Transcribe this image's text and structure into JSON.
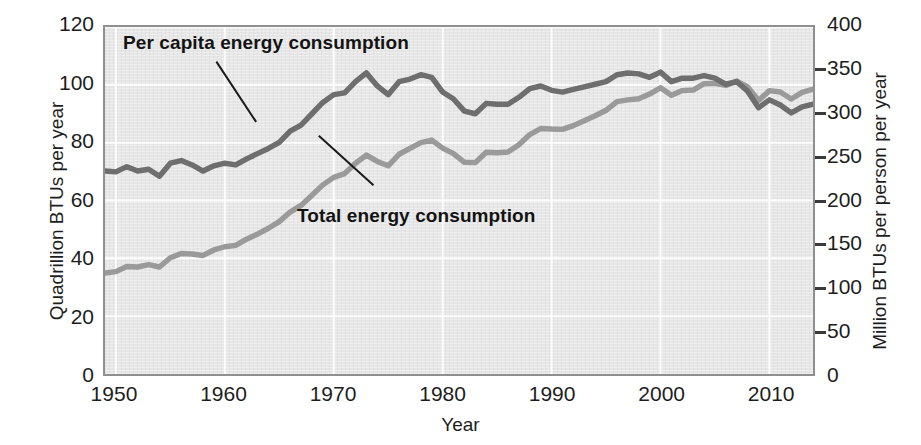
{
  "chart_data": {
    "type": "line",
    "title": "",
    "xlabel": "Year",
    "ylabel": "Quadrillion BTUs per year",
    "ylabel_right": "Million BTUs per person per year",
    "xlim": [
      1949,
      2014
    ],
    "ylim": [
      0,
      120
    ],
    "ylim_right": [
      0,
      400
    ],
    "grid": true,
    "legend_position": "in-plot-annotations",
    "xticks": [
      1950,
      1960,
      1970,
      1980,
      1990,
      2000,
      2010
    ],
    "xtick_labels": [
      "1950",
      "1960",
      "1970",
      "1980",
      "1990",
      "2000",
      "2010"
    ],
    "yticks_left": [
      0,
      20,
      40,
      60,
      80,
      100,
      120
    ],
    "ytick_labels_left": [
      "0",
      "20",
      "40",
      "60",
      "80",
      "100",
      "120"
    ],
    "yticks_right": [
      0,
      50,
      100,
      150,
      200,
      250,
      300,
      350,
      400
    ],
    "ytick_labels_right": [
      "0",
      "50",
      "100",
      "150",
      "200",
      "250",
      "300",
      "350",
      "400"
    ],
    "x": [
      1949,
      1950,
      1951,
      1952,
      1953,
      1954,
      1955,
      1956,
      1957,
      1958,
      1959,
      1960,
      1961,
      1962,
      1963,
      1964,
      1965,
      1966,
      1967,
      1968,
      1969,
      1970,
      1971,
      1972,
      1973,
      1974,
      1975,
      1976,
      1977,
      1978,
      1979,
      1980,
      1981,
      1982,
      1983,
      1984,
      1985,
      1986,
      1987,
      1988,
      1989,
      1990,
      1991,
      1992,
      1993,
      1994,
      1995,
      1996,
      1997,
      1998,
      1999,
      2000,
      2001,
      2002,
      2003,
      2004,
      2005,
      2006,
      2007,
      2008,
      2009,
      2010,
      2011,
      2012,
      2013,
      2014
    ],
    "series": [
      {
        "name": "Per capita energy consumption",
        "axis": "right",
        "units": "Million BTUs per person per year",
        "color": "#6e6e6e",
        "values": [
          234,
          233,
          239,
          234,
          236,
          228,
          243,
          246,
          241,
          234,
          240,
          243,
          241,
          248,
          254,
          260,
          267,
          280,
          287,
          300,
          313,
          322,
          324,
          337,
          347,
          332,
          322,
          337,
          340,
          345,
          342,
          325,
          317,
          303,
          300,
          312,
          311,
          311,
          319,
          329,
          332,
          327,
          325,
          328,
          331,
          334,
          337,
          345,
          347,
          346,
          342,
          348,
          337,
          341,
          341,
          344,
          341,
          334,
          337,
          326,
          307,
          316,
          310,
          301,
          308,
          311
        ]
      },
      {
        "name": "Total energy consumption",
        "axis": "left",
        "units": "Quadrillion BTUs per year",
        "color": "#9a9a9a",
        "values": [
          34.9,
          35.4,
          37.2,
          37.0,
          37.8,
          37.0,
          40.2,
          41.7,
          41.5,
          41.0,
          42.9,
          44.0,
          44.5,
          46.6,
          48.4,
          50.4,
          52.7,
          56.0,
          58.3,
          61.8,
          65.4,
          68.0,
          69.3,
          72.9,
          75.7,
          73.5,
          72.0,
          76.0,
          78.0,
          80.0,
          80.9,
          78.1,
          76.2,
          73.2,
          73.1,
          76.7,
          76.5,
          76.8,
          79.3,
          82.8,
          84.9,
          84.7,
          84.6,
          85.9,
          87.6,
          89.3,
          91.2,
          94.2,
          94.8,
          95.2,
          96.8,
          99.0,
          96.4,
          98.0,
          98.2,
          100.4,
          100.5,
          99.8,
          101.3,
          99.3,
          94.6,
          98.0,
          97.5,
          95.1,
          97.4,
          98.5
        ]
      }
    ],
    "annotations": [
      {
        "text": "Per capita energy consumption",
        "points_to_series": "Per capita energy consumption",
        "leader_line": true
      },
      {
        "text": "Total energy consumption",
        "points_to_series": "Total energy consumption",
        "leader_line": true
      }
    ]
  },
  "style": {
    "plot_background": "#e7e7e7",
    "grid_color": "#ffffff",
    "frame_color": "#8f8f8f",
    "page_background": "#ffffff",
    "text_color": "#1d1d1d"
  }
}
